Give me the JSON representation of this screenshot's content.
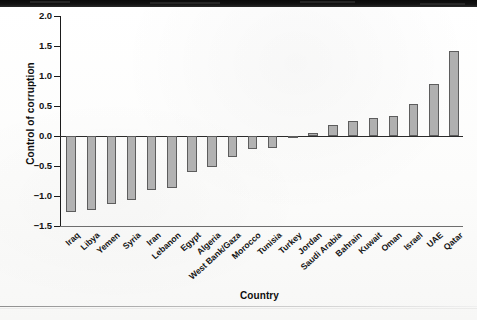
{
  "figure": {
    "y_axis_title": "Control of corruption",
    "x_axis_title": "Country"
  },
  "chart_data": {
    "type": "bar",
    "title": "",
    "xlabel": "Country",
    "ylabel": "Control of corruption",
    "ylim": [
      -1.5,
      2.0
    ],
    "yticks": [
      2.0,
      1.5,
      1.0,
      0.5,
      0.0,
      -0.5,
      -1.0,
      -1.5
    ],
    "ytick_labels": [
      "2.0",
      "1.5",
      "1.0",
      "0.5",
      "0.0",
      "−0.5",
      "−1.0",
      "−1.5"
    ],
    "grid": false,
    "legend": null,
    "bar_color": "#b2b2b2",
    "bar_edge_color": "#5d5d5d",
    "categories": [
      "Iraq",
      "Libya",
      "Yemen",
      "Syria",
      "Iran",
      "Lebanon",
      "Egypt",
      "Algeria",
      "West Bank/Gaza",
      "Morocco",
      "Tunisia",
      "Turkey",
      "Jordan",
      "Saudi Arabia",
      "Bahrain",
      "Kuwait",
      "Oman",
      "Israel",
      "UAE",
      "Qatar"
    ],
    "values": [
      -1.27,
      -1.23,
      -1.13,
      -1.07,
      -0.9,
      -0.87,
      -0.6,
      -0.52,
      -0.35,
      -0.22,
      -0.2,
      -0.03,
      0.05,
      0.18,
      0.25,
      0.3,
      0.33,
      0.53,
      0.87,
      1.42
    ]
  }
}
